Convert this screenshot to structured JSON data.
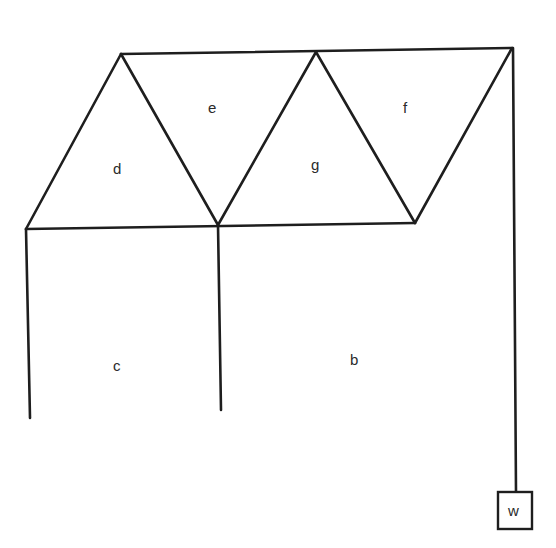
{
  "diagram": {
    "type": "truss",
    "regions": [
      {
        "id": "e",
        "label": "e"
      },
      {
        "id": "f",
        "label": "f"
      },
      {
        "id": "d",
        "label": "d"
      },
      {
        "id": "g",
        "label": "g"
      },
      {
        "id": "c",
        "label": "c"
      },
      {
        "id": "b",
        "label": "b"
      }
    ],
    "load": {
      "label": "w"
    }
  }
}
